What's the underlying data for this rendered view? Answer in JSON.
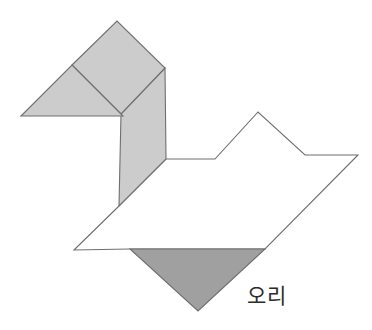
{
  "figure": {
    "caption": "오리",
    "caption_language": "Korean",
    "caption_meaning": "duck",
    "background_color": "#ffffff",
    "outline_color": "#6f6f6f",
    "fill_light": "#cccccc",
    "fill_dark": "#a0a0a0",
    "fill_white": "#ffffff",
    "canvas": {
      "width": 372,
      "height": 330
    },
    "pieces": [
      {
        "id": "beak-triangle",
        "name": "beak-triangle",
        "shape": "triangle",
        "fill": "#cccccc",
        "points": "21,116 72,65 123,116"
      },
      {
        "id": "head-square",
        "name": "head-square",
        "shape": "square",
        "fill": "#cccccc",
        "points": "72,65 117,21 165,68 121,114"
      },
      {
        "id": "neck-parallelogram",
        "name": "neck-parallelogram",
        "shape": "parallelogram",
        "fill": "#cccccc",
        "points": "121,114 165,68 166,159 119,206"
      },
      {
        "id": "body-large-triangle",
        "name": "body-large-triangle",
        "shape": "triangle",
        "fill": "#ffffff",
        "points": "166,159 258,112 305,155 358,155 265,249 130,249 74,250 119,206"
      },
      {
        "id": "tail-triangle",
        "name": "tail-triangle",
        "shape": "triangle",
        "fill": "#a0a0a0",
        "points": "130,249 265,249 198,311"
      }
    ],
    "body_outline_points": "166,159 215,159 258,112 305,155 358,155 265,249 130,249 74,250 119,206"
  }
}
